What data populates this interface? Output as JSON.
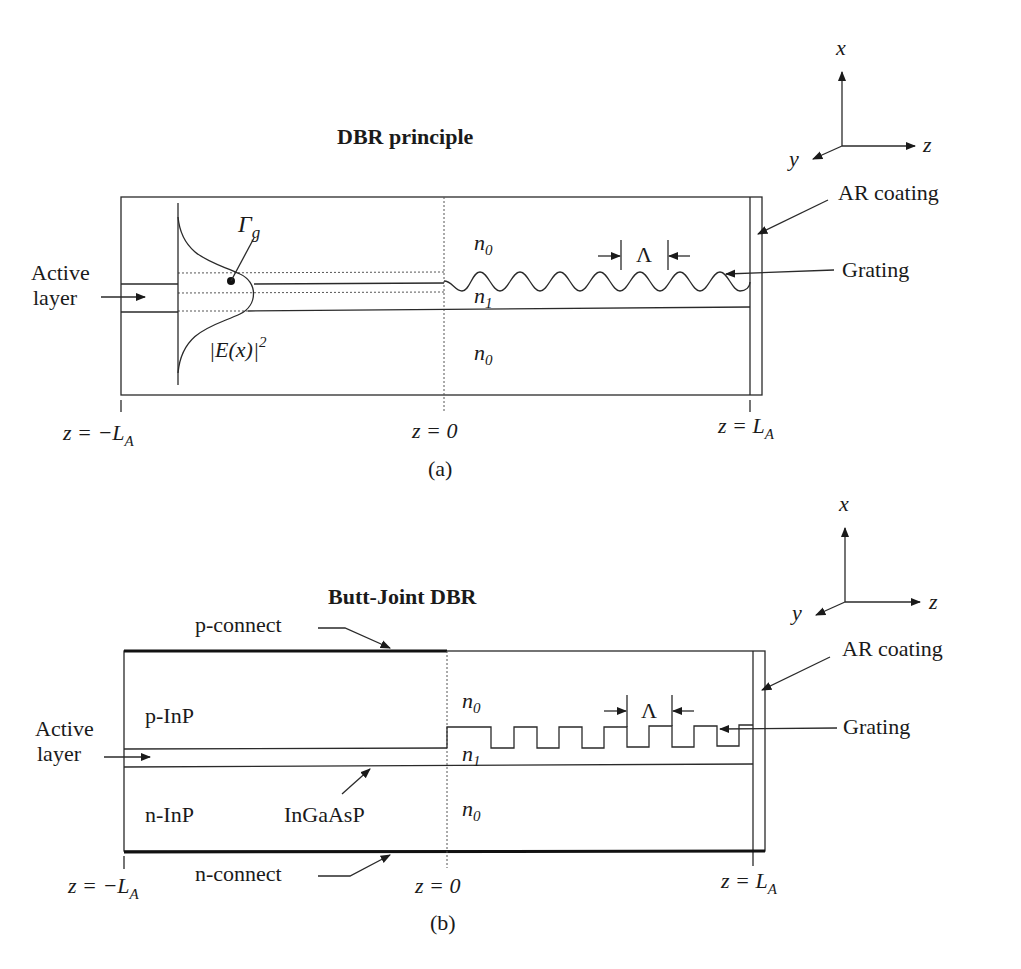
{
  "figure_a": {
    "title": "DBR principle",
    "caption": "(a)",
    "labels": {
      "active_layer_line1": "Active",
      "active_layer_line2": "layer",
      "gamma": "Γ",
      "gamma_sub": "g",
      "field": "|E(x)|",
      "field_sup": "2",
      "n0_top": "n",
      "n0_top_sub": "0",
      "n1": "n",
      "n1_sub": "1",
      "n0_bottom": "n",
      "n0_bottom_sub": "0",
      "period": "Λ",
      "ar_coating": "AR coating",
      "grating": "Grating",
      "z_left": "z = −L",
      "z_left_sub": "A",
      "z_zero": "z = 0",
      "z_right": "z = L",
      "z_right_sub": "A"
    },
    "axes": {
      "x": "x",
      "y": "y",
      "z": "z"
    }
  },
  "figure_b": {
    "title": "Butt-Joint DBR",
    "caption": "(b)",
    "labels": {
      "p_connect": "p-connect",
      "n_connect": "n-connect",
      "p_inp": "p-InP",
      "n_inp": "n-InP",
      "ingaasp": "InGaAsP",
      "active_layer_line1": "Active",
      "active_layer_line2": "layer",
      "n0_top": "n",
      "n0_top_sub": "0",
      "n1": "n",
      "n1_sub": "1",
      "n0_bottom": "n",
      "n0_bottom_sub": "0",
      "period": "Λ",
      "ar_coating": "AR coating",
      "grating": "Grating",
      "z_left": "z = −L",
      "z_left_sub": "A",
      "z_zero": "z = 0",
      "z_right": "z = L",
      "z_right_sub": "A"
    },
    "axes": {
      "x": "x",
      "y": "y",
      "z": "z"
    }
  }
}
